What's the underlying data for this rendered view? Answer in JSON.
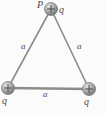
{
  "figure": {
    "type": "physics-diagram",
    "background_color": "#fbfbfb",
    "line_color": "#8c8c8c",
    "sphere_fill_light": "#d8d8d8",
    "sphere_fill_dark": "#6e6e6e",
    "label_color": "#4a4a4a",
    "vertices": [
      {
        "id": "top",
        "name": "top-charge",
        "cx": 51,
        "cy": 9,
        "r": 6.5,
        "sign": "+",
        "point_label": "P",
        "charge_label": "q"
      },
      {
        "id": "bottom-left",
        "name": "bottom-left-charge",
        "cx": 8,
        "cy": 88,
        "r": 6.5,
        "sign": "+",
        "point_label": "",
        "charge_label": "q"
      },
      {
        "id": "bottom-right",
        "name": "bottom-right-charge",
        "cx": 89,
        "cy": 89,
        "r": 6.5,
        "sign": "+",
        "point_label": "",
        "charge_label": "q"
      }
    ],
    "sides": [
      {
        "id": "left",
        "label": "a"
      },
      {
        "id": "right",
        "label": "a"
      },
      {
        "id": "bottom",
        "label": "a"
      }
    ],
    "labels": {
      "point_P": "P",
      "charge_top": "q",
      "charge_bottom_left": "q",
      "charge_bottom_right": "q",
      "side_left": "a",
      "side_right": "a",
      "side_bottom": "a",
      "plus_sign": "+"
    }
  }
}
